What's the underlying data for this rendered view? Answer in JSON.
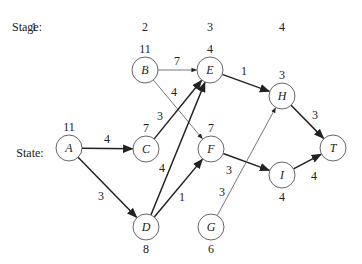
{
  "row_labels": {
    "stage": "Stage:",
    "state": "State:"
  },
  "stages": [
    {
      "label": "1",
      "x": 34
    },
    {
      "label": "2",
      "x": 145
    },
    {
      "label": "3",
      "x": 210
    },
    {
      "label": "4",
      "x": 282
    }
  ],
  "nodes": [
    {
      "id": "A",
      "label": "A",
      "value": "11",
      "x": 69,
      "y": 148,
      "value_pos": "above"
    },
    {
      "id": "B",
      "label": "B",
      "value": "11",
      "x": 145,
      "y": 70,
      "value_pos": "above"
    },
    {
      "id": "C",
      "label": "C",
      "value": "7",
      "x": 146,
      "y": 149,
      "value_pos": "above"
    },
    {
      "id": "D",
      "label": "D",
      "value": "8",
      "x": 146,
      "y": 227,
      "value_pos": "below"
    },
    {
      "id": "E",
      "label": "E",
      "value": "4",
      "x": 210,
      "y": 70,
      "value_pos": "above"
    },
    {
      "id": "F",
      "label": "F",
      "value": "7",
      "x": 211,
      "y": 149,
      "value_pos": "above"
    },
    {
      "id": "G",
      "label": "G",
      "value": "6",
      "x": 211,
      "y": 227,
      "value_pos": "below"
    },
    {
      "id": "H",
      "label": "H",
      "value": "3",
      "x": 282,
      "y": 96,
      "value_pos": "above"
    },
    {
      "id": "I",
      "label": "I",
      "value": "4",
      "x": 282,
      "y": 175,
      "value_pos": "below"
    },
    {
      "id": "T",
      "label": "T",
      "value": "",
      "x": 333,
      "y": 148,
      "value_pos": "none"
    }
  ],
  "edges": [
    {
      "from": "A",
      "to": "C",
      "weight": "4",
      "optimal": true,
      "lx": 107,
      "ly": 139
    },
    {
      "from": "A",
      "to": "D",
      "weight": "3",
      "optimal": true,
      "lx": 101,
      "ly": 196
    },
    {
      "from": "B",
      "to": "E",
      "weight": "7",
      "optimal": false,
      "lx": 177,
      "ly": 61
    },
    {
      "from": "B",
      "to": "F",
      "weight": "4",
      "optimal": false,
      "lx": 174,
      "ly": 92
    },
    {
      "from": "C",
      "to": "E",
      "weight": "3",
      "optimal": true,
      "lx": 160,
      "ly": 116
    },
    {
      "from": "D",
      "to": "E",
      "weight": "4",
      "optimal": true,
      "lx": 162,
      "ly": 168
    },
    {
      "from": "D",
      "to": "F",
      "weight": "1",
      "optimal": true,
      "lx": 182,
      "ly": 197
    },
    {
      "from": "E",
      "to": "H",
      "weight": "1",
      "optimal": true,
      "lx": 244,
      "ly": 71
    },
    {
      "from": "F",
      "to": "I",
      "weight": "3",
      "optimal": true,
      "lx": 229,
      "ly": 170
    },
    {
      "from": "G",
      "to": "H",
      "weight": "3",
      "optimal": false,
      "lx": 222,
      "ly": 192
    },
    {
      "from": "H",
      "to": "T",
      "weight": "3",
      "optimal": true,
      "lx": 315,
      "ly": 115
    },
    {
      "from": "I",
      "to": "T",
      "weight": "4",
      "optimal": true,
      "lx": 314,
      "ly": 176
    }
  ],
  "style": {
    "line_color": "#222222",
    "thin_color": "#555555",
    "node_stroke": "#555555",
    "node_radius": 13
  }
}
